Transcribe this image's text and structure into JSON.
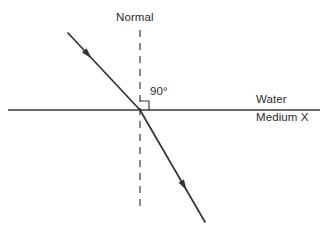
{
  "diagram": {
    "type": "optics-refraction-diagram",
    "background_color": "#ffffff",
    "stroke_color": "#3a3a3a",
    "ray_color": "#333333",
    "text_color": "#2b2b2b",
    "labels": {
      "normal": "Normal",
      "angle": "90°",
      "upper_medium": "Water",
      "lower_medium": "Medium X"
    },
    "elements": {
      "interface_line": {
        "name": "boundary between Water and Medium X",
        "x1": 8,
        "y1": 110,
        "x2": 320,
        "y2": 110
      },
      "normal_line": {
        "name": "dashed normal perpendicular to interface",
        "x1": 140,
        "y1": 30,
        "x2": 140,
        "y2": 210,
        "dash_pattern": "7 6"
      },
      "incident_ray": {
        "name": "incident ray in Water",
        "x1": 68,
        "y1": 33,
        "x2": 140,
        "y2": 110,
        "arrow_at_x": 88,
        "arrow_at_y": 54.5
      },
      "refracted_ray": {
        "name": "refracted ray in Medium X",
        "x1": 140,
        "y1": 110,
        "x2": 205,
        "y2": 222,
        "arrow_at_x": 184,
        "arrow_at_y": 185.8
      },
      "right_angle_marker": {
        "name": "right angle square at point of incidence",
        "x": 140,
        "y": 110,
        "size": 9
      },
      "incidence_point": {
        "x": 140,
        "y": 110
      }
    }
  }
}
